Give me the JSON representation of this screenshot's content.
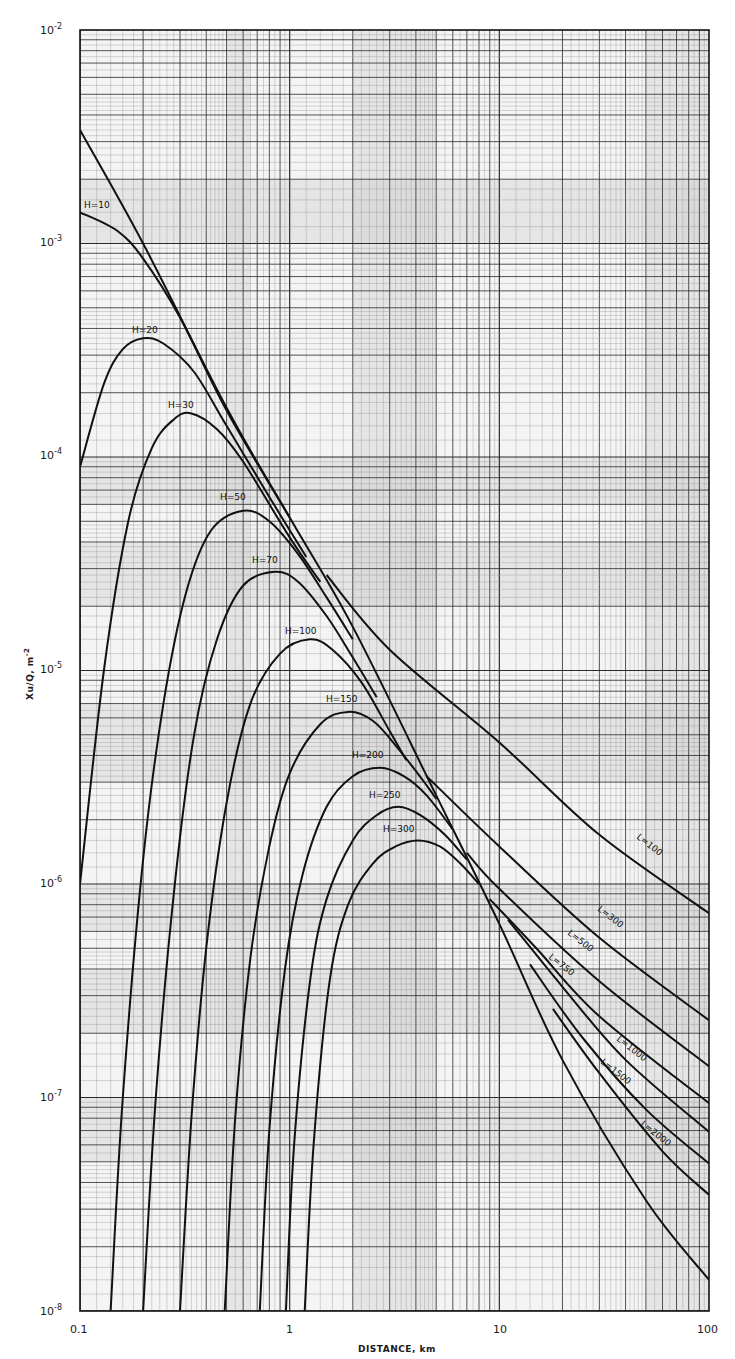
{
  "chart_data": {
    "type": "line",
    "title": "",
    "xlabel": "DISTANCE, km",
    "ylabel": "Xu/Q, m^-2",
    "xscale": "log",
    "yscale": "log",
    "xlim": [
      0.1,
      100
    ],
    "ylim": [
      1e-08,
      0.01
    ],
    "grid": true,
    "x_ticks": [
      {
        "value": 0.1,
        "label": "0.1"
      },
      {
        "value": 1,
        "label": "1"
      },
      {
        "value": 10,
        "label": "10"
      },
      {
        "value": 100,
        "label": "100"
      }
    ],
    "y_ticks": [
      {
        "value": 0.01,
        "label": "10",
        "exp": "-2"
      },
      {
        "value": 0.001,
        "label": "10",
        "exp": "-3"
      },
      {
        "value": 0.0001,
        "label": "10",
        "exp": "-4"
      },
      {
        "value": 1e-05,
        "label": "10",
        "exp": "-5"
      },
      {
        "value": 1e-06,
        "label": "10",
        "exp": "-6"
      },
      {
        "value": 1e-07,
        "label": "10",
        "exp": "-7"
      },
      {
        "value": 1e-08,
        "label": "10",
        "exp": "-8"
      }
    ],
    "series": [
      {
        "name": "Envelope (ground-level, no lid)",
        "label": "",
        "x": [
          0.1,
          0.2,
          0.5,
          1,
          2,
          5,
          10,
          20,
          50,
          100
        ],
        "y": [
          0.0034,
          0.001,
          0.00017,
          5.2e-05,
          1.6e-05,
          2.6e-06,
          6.5e-07,
          1.5e-07,
          3.3e-08,
          1.4e-08
        ]
      },
      {
        "name": "H=10",
        "label": "H=10",
        "x": [
          0.1,
          0.15,
          0.2,
          0.3,
          0.5,
          1
        ],
        "y": [
          0.0014,
          0.00115,
          0.00085,
          0.00045,
          0.000165,
          5.2e-05
        ]
      },
      {
        "name": "H=20",
        "label": "H=20",
        "x": [
          0.1,
          0.13,
          0.16,
          0.2,
          0.25,
          0.35,
          0.5,
          0.8,
          1.2
        ],
        "y": [
          9e-05,
          0.00022,
          0.00032,
          0.00036,
          0.00034,
          0.00025,
          0.00014,
          6.5e-05,
          3.4e-05
        ]
      },
      {
        "name": "H=30",
        "label": "H=30",
        "x": [
          0.1,
          0.13,
          0.17,
          0.22,
          0.28,
          0.34,
          0.45,
          0.6,
          1.0,
          1.4
        ],
        "y": [
          1e-06,
          1e-05,
          5e-05,
          0.00011,
          0.00015,
          0.00016,
          0.000135,
          9.5e-05,
          4.2e-05,
          2.6e-05
        ]
      },
      {
        "name": "H=50",
        "label": "H=50",
        "x": [
          0.14,
          0.16,
          0.2,
          0.25,
          0.32,
          0.42,
          0.6,
          0.8,
          1.1,
          1.5,
          2.0
        ],
        "y": [
          1e-08,
          1e-07,
          1.3e-06,
          7e-06,
          2.3e-05,
          4.5e-05,
          5.6e-05,
          5e-05,
          3.5e-05,
          2.2e-05,
          1.4e-05
        ]
      },
      {
        "name": "H=70",
        "label": "H=70",
        "x": [
          0.2,
          0.23,
          0.28,
          0.35,
          0.45,
          0.6,
          0.85,
          1.1,
          1.5,
          2.0,
          2.6
        ],
        "y": [
          1e-08,
          1e-07,
          9e-07,
          5e-06,
          1.4e-05,
          2.5e-05,
          2.9e-05,
          2.6e-05,
          1.8e-05,
          1.15e-05,
          7.5e-06
        ]
      },
      {
        "name": "H=100",
        "label": "H=100",
        "x": [
          0.3,
          0.34,
          0.4,
          0.5,
          0.65,
          0.9,
          1.25,
          1.6,
          2.2,
          3.0,
          3.6
        ],
        "y": [
          1e-08,
          8e-08,
          5e-07,
          2.4e-06,
          7e-06,
          1.2e-05,
          1.4e-05,
          1.25e-05,
          8.8e-06,
          5.2e-06,
          3.8e-06
        ]
      },
      {
        "name": "H=150",
        "label": "H=150",
        "x": [
          0.49,
          0.55,
          0.65,
          0.8,
          1.0,
          1.4,
          1.9,
          2.5,
          3.3,
          4.5,
          5.0
        ],
        "y": [
          1e-08,
          8e-08,
          4.5e-07,
          1.5e-06,
          3.3e-06,
          5.6e-06,
          6.4e-06,
          5.8e-06,
          4.3e-06,
          2.9e-06,
          2.5e-06
        ]
      },
      {
        "name": "H=200",
        "label": "H=200",
        "x": [
          0.72,
          0.8,
          0.95,
          1.15,
          1.5,
          2.0,
          2.7,
          3.5,
          4.5,
          6.0
        ],
        "y": [
          1e-08,
          7e-08,
          4e-07,
          1.1e-06,
          2.3e-06,
          3.2e-06,
          3.5e-06,
          3.2e-06,
          2.6e-06,
          1.8e-06
        ]
      },
      {
        "name": "H=250",
        "label": "H=250",
        "x": [
          0.96,
          1.05,
          1.25,
          1.5,
          2.0,
          2.6,
          3.3,
          4.2,
          5.5,
          7.0
        ],
        "y": [
          1e-08,
          6e-08,
          3.5e-07,
          8.5e-07,
          1.6e-06,
          2.1e-06,
          2.3e-06,
          2.1e-06,
          1.7e-06,
          1.3e-06
        ]
      },
      {
        "name": "H=300",
        "label": "H=300",
        "x": [
          1.18,
          1.3,
          1.55,
          1.9,
          2.5,
          3.2,
          4.1,
          5.2,
          6.5,
          8.0
        ],
        "y": [
          1e-08,
          6e-08,
          3.5e-07,
          8e-07,
          1.25e-06,
          1.5e-06,
          1.6e-06,
          1.5e-06,
          1.25e-06,
          1e-06
        ]
      },
      {
        "name": "L=100",
        "label": "L=100",
        "x": [
          1.5,
          3,
          10,
          30,
          100
        ],
        "y": [
          2.8e-05,
          1.25e-05,
          4.6e-06,
          1.7e-06,
          7.3e-07
        ]
      },
      {
        "name": "L=300",
        "label": "L=300",
        "x": [
          4.5,
          10,
          30,
          100
        ],
        "y": [
          3.2e-06,
          1.5e-06,
          5.6e-07,
          2.3e-07
        ]
      },
      {
        "name": "L=500",
        "label": "L=500",
        "x": [
          7,
          10,
          30,
          100
        ],
        "y": [
          1.4e-06,
          9.5e-07,
          3.5e-07,
          1.4e-07
        ]
      },
      {
        "name": "L=750",
        "label": "L=750",
        "x": [
          9,
          15,
          30,
          100
        ],
        "y": [
          8.5e-07,
          5e-07,
          2.4e-07,
          9.4e-08
        ]
      },
      {
        "name": "L=1000",
        "label": "L=1000",
        "x": [
          11,
          20,
          40,
          100
        ],
        "y": [
          6.8e-07,
          3.3e-07,
          1.5e-07,
          6.9e-08
        ]
      },
      {
        "name": "L=1500",
        "label": "L=1500",
        "x": [
          14,
          25,
          50,
          100
        ],
        "y": [
          4.2e-07,
          1.9e-07,
          8.8e-08,
          4.9e-08
        ]
      },
      {
        "name": "L=2000",
        "label": "L=2000",
        "x": [
          18,
          30,
          60,
          100
        ],
        "y": [
          2.6e-07,
          1.3e-07,
          5.6e-08,
          3.5e-08
        ]
      }
    ],
    "annotations": [
      "H=10",
      "H=20",
      "H=30",
      "H=50",
      "H=70",
      "H=100",
      "H=150",
      "H=200",
      "H=250",
      "H=300",
      "L=100",
      "L=300",
      "L=500",
      "L=750",
      "L=1000",
      "L=1500",
      "L=2000"
    ]
  },
  "labels": {
    "H10": "H=10",
    "H20": "H=20",
    "H30": "H=30",
    "H50": "H=50",
    "H70": "H=70",
    "H100": "H=100",
    "H150": "H=150",
    "H200": "H=200",
    "H250": "H=250",
    "H300": "H=300",
    "L100": "L=100",
    "L300": "L=300",
    "L500": "L=500",
    "L750": "L=750",
    "L1000": "L=1000",
    "L1500": "L=1500",
    "L2000": "L=2000"
  },
  "axes": {
    "xlabel": "DISTANCE, km",
    "ylabel_main": "Xu/Q, m",
    "ylabel_exp": "-2",
    "x_ticks": [
      "0.1",
      "1",
      "10",
      "100"
    ],
    "y_base": "10",
    "y_exps": [
      "-2",
      "-3",
      "-4",
      "-5",
      "-6",
      "-7",
      "-8"
    ]
  },
  "colors": {
    "grid_major": "#2a2a2a",
    "grid_minor": "#8a8a8a",
    "curve": "#111111",
    "shade": "#c8c8c8",
    "paper": "#f4f4f4"
  }
}
